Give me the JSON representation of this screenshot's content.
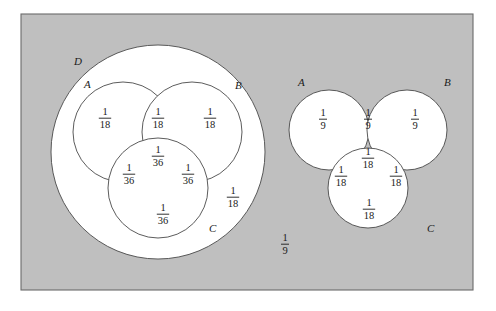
{
  "figure": {
    "background_color": "#ffffff",
    "universe_fill": "#bfbfbf",
    "universe_border": "#6b6b6b",
    "circle_fill": "#ffffff",
    "circle_stroke": "#4a4a4a",
    "text_color": "#1a1a1a"
  },
  "universe": {
    "name": "sample-space-rectangle",
    "x": 21,
    "y": 14,
    "width": 452,
    "height": 276
  },
  "left_diagram": {
    "name": "left-venn-diagram",
    "outer_circle": {
      "label": "D",
      "label_x": 74,
      "label_y": 65,
      "cx": 158,
      "cy": 152,
      "r": 107
    },
    "circles": [
      {
        "label": "A",
        "label_x": 84,
        "label_y": 88,
        "cx": 123,
        "cy": 132,
        "r": 50
      },
      {
        "label": "B",
        "label_x": 235,
        "label_y": 89,
        "cx": 192,
        "cy": 132,
        "r": 50
      },
      {
        "label": "C",
        "label_x": 209,
        "label_y": 232,
        "cx": 158,
        "cy": 188,
        "r": 50
      }
    ],
    "regions": [
      {
        "name": "region-A-only",
        "numerator": "1",
        "denominator": "18",
        "x": 105,
        "y": 117
      },
      {
        "name": "region-A-and-B",
        "numerator": "1",
        "denominator": "18",
        "x": 158,
        "y": 117
      },
      {
        "name": "region-B-only",
        "numerator": "1",
        "denominator": "18",
        "x": 210,
        "y": 117
      },
      {
        "name": "region-A-B-C",
        "numerator": "1",
        "denominator": "36",
        "x": 158,
        "y": 155
      },
      {
        "name": "region-A-and-C",
        "numerator": "1",
        "denominator": "36",
        "x": 129,
        "y": 173
      },
      {
        "name": "region-B-and-C",
        "numerator": "1",
        "denominator": "36",
        "x": 188,
        "y": 173
      },
      {
        "name": "region-C-only",
        "numerator": "1",
        "denominator": "36",
        "x": 163,
        "y": 213
      },
      {
        "name": "region-D-only",
        "numerator": "1",
        "denominator": "18",
        "x": 233,
        "y": 196
      }
    ]
  },
  "right_diagram": {
    "name": "right-venn-diagram",
    "circles": [
      {
        "label": "A",
        "label_x": 298,
        "label_y": 86,
        "cx": 329,
        "cy": 130,
        "r": 40
      },
      {
        "label": "B",
        "label_x": 444,
        "label_y": 86,
        "cx": 407,
        "cy": 130,
        "r": 40
      },
      {
        "label": "C",
        "label_x": 427,
        "label_y": 232,
        "cx": 368,
        "cy": 188,
        "r": 40
      }
    ],
    "regions": [
      {
        "name": "region-A-only",
        "numerator": "1",
        "denominator": "9",
        "x": 323,
        "y": 118
      },
      {
        "name": "region-A-and-B",
        "numerator": "1",
        "denominator": "9",
        "x": 368,
        "y": 118
      },
      {
        "name": "region-B-only",
        "numerator": "1",
        "denominator": "9",
        "x": 415,
        "y": 118
      },
      {
        "name": "region-A-B-C",
        "numerator": "1",
        "denominator": "18",
        "x": 368,
        "y": 157
      },
      {
        "name": "region-A-and-C",
        "numerator": "1",
        "denominator": "18",
        "x": 341,
        "y": 175
      },
      {
        "name": "region-B-and-C",
        "numerator": "1",
        "denominator": "18",
        "x": 396,
        "y": 175
      },
      {
        "name": "region-C-only",
        "numerator": "1",
        "denominator": "18",
        "x": 369,
        "y": 208
      }
    ]
  },
  "outside_region": {
    "name": "outside-all-sets",
    "numerator": "1",
    "denominator": "9",
    "x": 285,
    "y": 243
  },
  "chart_data": {
    "type": "diagram",
    "subtype": "venn",
    "panels": [
      {
        "panel": "left",
        "sets": [
          "A",
          "B",
          "C",
          "D"
        ],
        "note": "Sets A, B, C are nested inside set D",
        "assignments": [
          {
            "region": "A only",
            "value": "1/18",
            "numeric": 0.05556
          },
          {
            "region": "A ∩ B only",
            "value": "1/18",
            "numeric": 0.05556
          },
          {
            "region": "B only",
            "value": "1/18",
            "numeric": 0.05556
          },
          {
            "region": "A ∩ B ∩ C",
            "value": "1/36",
            "numeric": 0.02778
          },
          {
            "region": "A ∩ C only",
            "value": "1/36",
            "numeric": 0.02778
          },
          {
            "region": "B ∩ C only",
            "value": "1/36",
            "numeric": 0.02778
          },
          {
            "region": "C only",
            "value": "1/36",
            "numeric": 0.02778
          },
          {
            "region": "D only",
            "value": "1/18",
            "numeric": 0.05556
          }
        ]
      },
      {
        "panel": "right",
        "sets": [
          "A",
          "B",
          "C"
        ],
        "note": "Three mutually overlapping circles",
        "assignments": [
          {
            "region": "A only",
            "value": "1/9",
            "numeric": 0.11111
          },
          {
            "region": "A ∩ B only",
            "value": "1/9",
            "numeric": 0.11111
          },
          {
            "region": "B only",
            "value": "1/9",
            "numeric": 0.11111
          },
          {
            "region": "A ∩ B ∩ C",
            "value": "1/18",
            "numeric": 0.05556
          },
          {
            "region": "A ∩ C only",
            "value": "1/18",
            "numeric": 0.05556
          },
          {
            "region": "B ∩ C only",
            "value": "1/18",
            "numeric": 0.05556
          },
          {
            "region": "C only",
            "value": "1/18",
            "numeric": 0.05556
          }
        ]
      },
      {
        "panel": "outside",
        "sets": [],
        "note": "Region of the sample space outside every circle",
        "assignments": [
          {
            "region": "complement of all sets",
            "value": "1/9",
            "numeric": 0.11111
          }
        ]
      }
    ]
  }
}
